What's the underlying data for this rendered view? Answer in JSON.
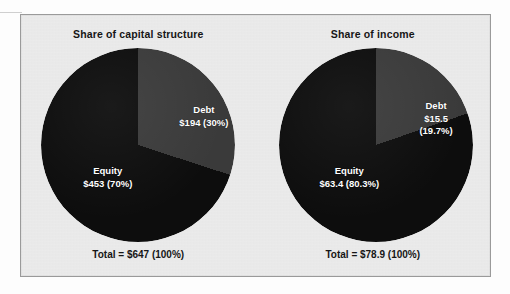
{
  "figure": {
    "panel_background": "#ebebeb",
    "panel_border": "#9a9a9a",
    "debt_color": "#3a3a3a",
    "equity_color": "#0d0d0d",
    "label_color": "#ffffff",
    "title_color": "#161616"
  },
  "charts": [
    {
      "title": "Share of capital structure",
      "total_label": "Total = $647 (100%)",
      "debt": {
        "name": "Debt",
        "value_label": "$194 (30%)",
        "value_line_1": "$194 (30%)",
        "value_line_2": "",
        "value": 194,
        "percent": 30
      },
      "equity": {
        "name": "Equity",
        "value_label": "$453 (70%)",
        "value_line_1": "$453 (70%)",
        "value_line_2": "",
        "value": 453,
        "percent": 70
      }
    },
    {
      "title": "Share of income",
      "total_label": "Total = $78.9 (100%)",
      "debt": {
        "name": "Debt",
        "value_label": "$15.5 (19.7%)",
        "value_line_1": "$15.5",
        "value_line_2": "(19.7%)",
        "value": 15.5,
        "percent": 19.7
      },
      "equity": {
        "name": "Equity",
        "value_label": "$63.4 (80.3%)",
        "value_line_1": "$63.4 (80.3%)",
        "value_line_2": "",
        "value": 63.4,
        "percent": 80.3
      }
    }
  ],
  "chart_data": [
    {
      "type": "pie",
      "title": "Share of capital structure",
      "categories": [
        "Debt",
        "Equity"
      ],
      "values": [
        194,
        453
      ],
      "percents": [
        30,
        70
      ],
      "data_labels": [
        "Debt\n$194 (30%)",
        "Equity\n$453 (70%)"
      ],
      "colors": [
        "#3a3a3a",
        "#0d0d0d"
      ],
      "total": 647,
      "total_label": "Total = $647 (100%)",
      "units": "dollars (millions)",
      "start_angle_deg": 0,
      "direction": "clockwise",
      "legend": "none",
      "xlabel": "",
      "ylabel": ""
    },
    {
      "type": "pie",
      "title": "Share of income",
      "categories": [
        "Debt",
        "Equity"
      ],
      "values": [
        15.5,
        63.4
      ],
      "percents": [
        19.7,
        80.3
      ],
      "data_labels": [
        "Debt\n$15.5\n(19.7%)",
        "Equity\n$63.4 (80.3%)"
      ],
      "colors": [
        "#3a3a3a",
        "#0d0d0d"
      ],
      "total": 78.9,
      "total_label": "Total = $78.9 (100%)",
      "units": "dollars (millions)",
      "start_angle_deg": 0,
      "direction": "clockwise",
      "legend": "none",
      "xlabel": "",
      "ylabel": ""
    }
  ]
}
